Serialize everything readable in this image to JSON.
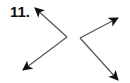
{
  "problem": {
    "number_label": "11."
  },
  "diagram": {
    "stroke_color": "#555555",
    "arrowhead_color": "#111111",
    "angles": [
      {
        "name": "left-angle",
        "vertex": [
          67,
          37
        ],
        "rays": [
          {
            "name": "ray-upper-left",
            "tip": [
              35,
              8
            ]
          },
          {
            "name": "ray-lower-left",
            "tip": [
              23,
              70
            ]
          }
        ]
      },
      {
        "name": "right-angle",
        "vertex": [
          80,
          38
        ],
        "rays": [
          {
            "name": "ray-upper-right",
            "tip": [
              118,
              18
            ]
          },
          {
            "name": "ray-lower-right",
            "tip": [
              118,
              80
            ]
          }
        ]
      }
    ]
  }
}
